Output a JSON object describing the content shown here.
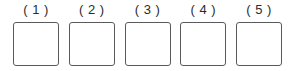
{
  "page": {
    "background_color": "#ffffff",
    "box_border_color": "#5a5a5a",
    "label_color": "#2b2b2b"
  },
  "answer_boxes": [
    {
      "label": "( 1 )",
      "value": ""
    },
    {
      "label": "( 2 )",
      "value": ""
    },
    {
      "label": "( 3 )",
      "value": ""
    },
    {
      "label": "( 4 )",
      "value": ""
    },
    {
      "label": "( 5 )",
      "value": ""
    }
  ]
}
